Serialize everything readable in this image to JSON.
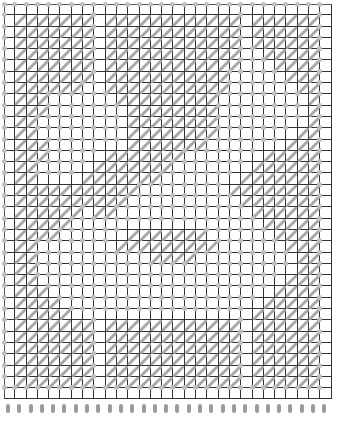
{
  "chart_data": {
    "type": "table",
    "title": "",
    "columns": 29,
    "rows": 35,
    "legend": {
      "1": "diagonal stitch (filled)",
      "0": "empty (dot)"
    },
    "colors": {
      "stitch": "#a8a8a8",
      "dot": "#bdbdbd",
      "grid": "#333333",
      "background": "#ffffff"
    },
    "grid": [
      "00000000000000000000000000000",
      "01111111011111111111101111110",
      "01111111011111111111101111110",
      "01111111011111111111101111110",
      "01111111011111111111100111110",
      "01111111011111111111100011110",
      "01111111011111111111000001110",
      "01111110011111111111000000110",
      "01110000001111111110000000010",
      "01110000000111111110000000010",
      "01100000000111111110000000010",
      "01100000000111111110000000110",
      "01110000000111111100000001110",
      "01110000011111110000000111110",
      "01100000111111100000001111110",
      "01100001111111000000011111110",
      "01111111111100000000111111110",
      "01111111111000000000011111110",
      "01111110110000000000001111110",
      "01111100000000000000000111110",
      "01111000000111111100000011110",
      "01100000001111111110000001110",
      "01100000000001111000000000110",
      "01100000000000000000000000110",
      "01100000000000000000000001110",
      "01110000000000000000000011110",
      "01111000000000000000000111110",
      "01111100000000000000001111110",
      "01111111011111111111101111110",
      "01111111011111111111101111110",
      "01111111011111111111101111110",
      "01111111011111111111101111110",
      "01111111011111111111101111110",
      "01111111011111111111101111110",
      "00000000000000000000000000000"
    ],
    "pegs": 29
  }
}
